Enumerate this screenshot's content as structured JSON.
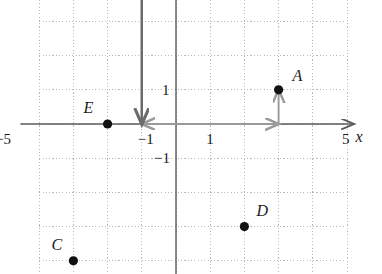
{
  "figure": {
    "kind": "coordinate-plane",
    "title": "",
    "x_axis_label": "x",
    "y_axis_label": ""
  },
  "chart_data": {
    "type": "scatter",
    "title": "",
    "xlabel": "x",
    "ylabel": "",
    "xlim": [
      -5,
      5
    ],
    "ylim": [
      -5,
      5
    ],
    "grid": true,
    "grid_style": "dotted",
    "grid_step": 1,
    "legend": "none",
    "x_ticks": [
      -5,
      -1,
      1,
      5
    ],
    "x_tick_labels": [
      "−5",
      "−1",
      "1",
      "5"
    ],
    "y_ticks": [
      1,
      -1
    ],
    "y_tick_labels": [
      "1",
      "−1"
    ],
    "points": [
      {
        "label": "A",
        "x": 3,
        "y": 1,
        "label_dx": 14,
        "label_dy": -22
      },
      {
        "label": "C",
        "x": -3,
        "y": -4,
        "label_dx": -22,
        "label_dy": -24
      },
      {
        "label": "D",
        "x": 2,
        "y": -3,
        "label_dx": 12,
        "label_dy": -24
      },
      {
        "label": "E",
        "x": -2,
        "y": 0,
        "label_dx": -24,
        "label_dy": -24
      },
      {
        "label": "",
        "x": -1,
        "y": 5,
        "label_dx": 0,
        "label_dy": 0
      }
    ],
    "vectors": [
      {
        "name": "horizontal-translation",
        "x1": -1,
        "y1": 0,
        "x2": 3,
        "y2": 0,
        "color": "#9a9a9a",
        "double_headed": true
      },
      {
        "name": "vertical-translation",
        "x1": -1,
        "y1": 0,
        "x2": -1,
        "y2": 5,
        "color": "#6b6b6b",
        "double_headed": true
      },
      {
        "name": "lift-to-point-a",
        "x1": 3,
        "y1": 0,
        "x2": 3,
        "y2": 1,
        "color": "#9a9a9a",
        "double_headed": false
      }
    ],
    "annotations": []
  },
  "colors": {
    "axis": "#5a5a5a",
    "grid": "#b9b9b9",
    "point": "#111111",
    "vector_light": "#9a9a9a",
    "vector_dark": "#6b6b6b",
    "text": "#1a1a1a"
  }
}
